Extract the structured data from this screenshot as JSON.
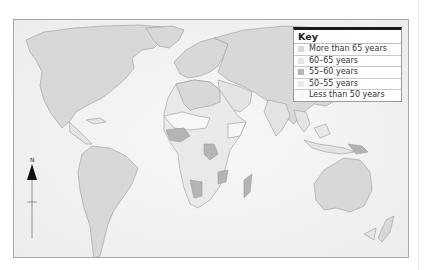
{
  "map": {
    "subject": "Life expectancy by country",
    "projection": "world map"
  },
  "key": {
    "title": "Key",
    "items": [
      {
        "label": "More than 65 years",
        "color": "#d8d8d8"
      },
      {
        "label": "60–65 years",
        "color": "#e4e4e4"
      },
      {
        "label": "55–60 years",
        "color": "#b4b4b4"
      },
      {
        "label": "50–55 years",
        "color": "#e9e9e9"
      },
      {
        "label": "Less than 50 years",
        "color": "#f7f7f7"
      }
    ]
  },
  "compass": {
    "label": "N",
    "icon": "north-arrow-icon"
  },
  "colors": {
    "frame_border": "#a8a8a8",
    "ocean": "#f4f4f4",
    "coastline": "#9a9a9a",
    "key_top_rule": "#1a1a1a"
  }
}
